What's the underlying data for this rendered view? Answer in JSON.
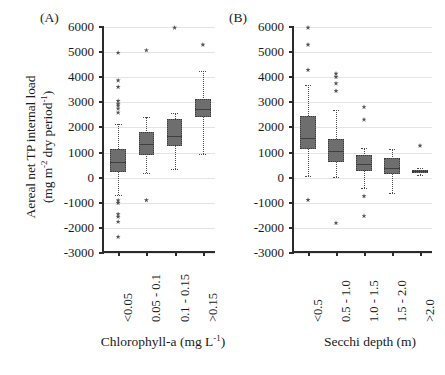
{
  "figure": {
    "y_axis_title_line1": "Aereal net TP internal load",
    "y_axis_title_line2_pre": "(mg m",
    "y_axis_title_line2_sup1": "-2",
    "y_axis_title_line2_mid": " dry period",
    "y_axis_title_line2_sup2": "-1",
    "y_axis_title_line2_post": ")",
    "panel_a_label": "(A)",
    "panel_b_label": "(B)"
  },
  "chart_data": [
    {
      "type": "box",
      "panel": "(A)",
      "title": "",
      "xlabel": "Chlorophyll-a (mg L-1)",
      "xlabel_text": "Chlorophyll-a (mg L",
      "xlabel_sup": "-1",
      "xlabel_tail": ")",
      "ylabel": "Aereal net TP internal load (mg m-2 dry period-1)",
      "ylim": [
        -3000,
        6000
      ],
      "yticks": [
        6000,
        5000,
        4000,
        3000,
        2000,
        1000,
        0,
        -1000,
        -2000,
        -3000
      ],
      "ytick_labels": [
        "6000",
        "5000",
        "4000",
        "3000",
        "2000",
        "1000",
        "0",
        "-1000",
        "-2000",
        "-3000"
      ],
      "grid": true,
      "legend": "none",
      "categories": [
        "<0.05",
        "0.05 - 0.1",
        "0.1 - 0.15",
        ">0.15"
      ],
      "boxes": [
        {
          "category": "<0.05",
          "whisker_low": -700,
          "q1": 230,
          "median": 620,
          "q3": 1160,
          "whisker_high": 2150,
          "outliers": [
            4980,
            3880,
            3620,
            3060,
            2950,
            2880,
            2760,
            2600,
            -900,
            -1000,
            -1450,
            -1550,
            -1750,
            -2350
          ]
        },
        {
          "category": "0.05 - 0.1",
          "whisker_low": 200,
          "q1": 900,
          "median": 1340,
          "q3": 1800,
          "whisker_high": 2400,
          "outliers": [
            5080,
            -890
          ]
        },
        {
          "category": "0.1 - 0.15",
          "whisker_low": 330,
          "q1": 1280,
          "median": 1640,
          "q3": 2330,
          "whisker_high": 2560,
          "outliers": [
            5980
          ]
        },
        {
          "category": ">0.15",
          "whisker_low": 950,
          "q1": 2420,
          "median": 2720,
          "q3": 3150,
          "whisker_high": 4250,
          "outliers": [
            5300
          ]
        }
      ]
    },
    {
      "type": "box",
      "panel": "(B)",
      "title": "",
      "xlabel": "Secchi depth (m)",
      "ylabel": "Aereal net TP internal load (mg m-2 dry period-1)",
      "ylim": [
        -3000,
        6000
      ],
      "yticks": [
        6000,
        5000,
        4000,
        3000,
        2000,
        1000,
        0,
        -1000,
        -2000,
        -3000
      ],
      "ytick_labels": [
        "6000",
        "5000",
        "4000",
        "3000",
        "2000",
        "1000",
        "0",
        "-1000",
        "-2000",
        "-3000"
      ],
      "grid": true,
      "legend": "none",
      "categories": [
        "<0.5",
        "0.5 - 1.0",
        "1.0 - 1.5",
        "1.5 - 2.0",
        ">2.0"
      ],
      "boxes": [
        {
          "category": "<0.5",
          "whisker_low": 50,
          "q1": 1130,
          "median": 1560,
          "q3": 2470,
          "whisker_high": 3700,
          "outliers": [
            5980,
            5300,
            4300,
            -880
          ]
        },
        {
          "category": "0.5 - 1.0",
          "whisker_low": 10,
          "q1": 620,
          "median": 1050,
          "q3": 1520,
          "whisker_high": 2680,
          "outliers": [
            4150,
            4020,
            3760,
            3460,
            -1800
          ]
        },
        {
          "category": "1.0 - 1.5",
          "whisker_low": -430,
          "q1": 250,
          "median": 560,
          "q3": 900,
          "whisker_high": 1180,
          "outliers": [
            2820,
            2320,
            -730,
            -1520
          ]
        },
        {
          "category": "1.5 - 2.0",
          "whisker_low": -620,
          "q1": 160,
          "median": 400,
          "q3": 800,
          "whisker_high": 1150,
          "outliers": []
        },
        {
          "category": ">2.0",
          "whisker_low": 120,
          "q1": 200,
          "median": 250,
          "q3": 320,
          "whisker_high": 400,
          "outliers": [
            1280
          ]
        }
      ]
    }
  ],
  "style": {
    "box_fill": "#6e6e6e",
    "axis_color": "#2b2b2b",
    "grid_color": "#e4e4e4",
    "outlier_color": "#555555"
  }
}
